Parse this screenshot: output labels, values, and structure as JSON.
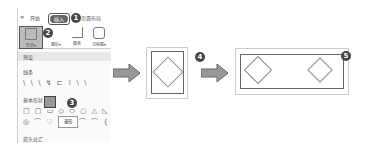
{
  "ribbon_tabs": [
    {
      "label": "开始"
    },
    {
      "label": "插入",
      "active": true
    },
    {
      "label": "页面布局"
    }
  ],
  "ribbon_buttons": [
    {
      "label": "形状▾",
      "icon": "shapes-icon",
      "selected": true
    },
    {
      "label": "图标▾",
      "icon": "icons-icon"
    },
    {
      "label": "图表",
      "icon": "chart-icon"
    },
    {
      "label": "流程图▾",
      "icon": "flowchart-icon"
    }
  ],
  "gallery": {
    "sections": [
      {
        "title": "预设"
      },
      {
        "title": "线条",
        "glyphs": "\\ \\ \\ ↯ ⊏ ⌇ \\ \\"
      },
      {
        "title": "基本形状",
        "row1": "□ ▢ ▭ ◇ ⬭ ○ △ ◺",
        "row2": "◎ ⌒ ♡ ⌂ ◠ ⌒ ⌒ { }"
      },
      {
        "title": "箭头总汇"
      }
    ],
    "tooltip": "菱形"
  },
  "steps": {
    "s1": "1",
    "s2": "2",
    "s3": "3",
    "s4": "4",
    "s5": "5"
  },
  "colors": {
    "badge": "#444444",
    "arrow_fill": "#999999",
    "border": "#666666"
  }
}
